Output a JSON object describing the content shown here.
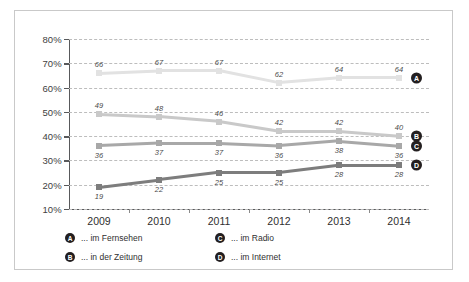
{
  "chart_data": {
    "type": "line",
    "title": "",
    "xlabel": "",
    "ylabel": "",
    "categories": [
      "2009",
      "2010",
      "2011",
      "2012",
      "2013",
      "2014"
    ],
    "ylim": [
      10,
      80
    ],
    "ytick_labels": [
      "10%",
      "20%",
      "30%",
      "40%",
      "50%",
      "60%",
      "70%",
      "80%"
    ],
    "yticks": [
      10,
      20,
      30,
      40,
      50,
      60,
      70,
      80
    ],
    "grid": true,
    "legend_position": "bottom-left",
    "series": [
      {
        "key": "A",
        "name": "... im Fernsehen",
        "color": "#e2e2e2",
        "label_position": "above",
        "values": [
          66,
          67,
          67,
          62,
          64,
          64
        ]
      },
      {
        "key": "B",
        "name": "... in der Zeitung",
        "color": "#c9c9c9",
        "label_position": "above",
        "values": [
          49,
          48,
          46,
          42,
          42,
          40
        ]
      },
      {
        "key": "C",
        "name": "... im Radio",
        "color": "#a8a8a8",
        "label_position": "below",
        "values": [
          36,
          37,
          37,
          36,
          38,
          36
        ]
      },
      {
        "key": "D",
        "name": "... im Internet",
        "color": "#7d7d7d",
        "label_position": "below",
        "values": [
          19,
          22,
          25,
          25,
          28,
          28
        ]
      }
    ]
  },
  "legend": {
    "items": [
      {
        "badge": "A",
        "label": "... im Fernsehen"
      },
      {
        "badge": "C",
        "label": "... im Radio"
      },
      {
        "badge": "B",
        "label": "... in der Zeitung"
      },
      {
        "badge": "D",
        "label": "... im Internet"
      }
    ]
  }
}
